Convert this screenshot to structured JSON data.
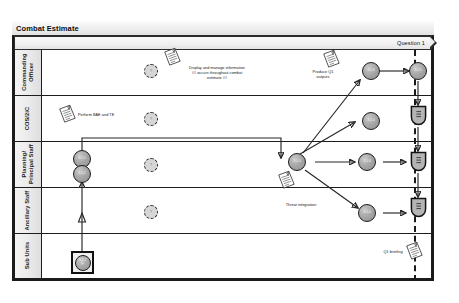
{
  "title": "Combat Estimate",
  "phase": {
    "label": "Question 1"
  },
  "lanes": [
    {
      "id": "commanding-officer",
      "label": "Commanding\nOfficer"
    },
    {
      "id": "cos-2ic",
      "label": "COS/2iC"
    },
    {
      "id": "planning-staff",
      "label": "Planning/\nPrincipal Staff"
    },
    {
      "id": "ancillary-staff",
      "label": "Ancillary Staff"
    },
    {
      "id": "sub-units",
      "label": "Sub Units"
    }
  ],
  "nodes": [
    {
      "id": "n-co-1",
      "label": "3.1.6",
      "lane": "commanding-officer"
    },
    {
      "id": "n-co-2",
      "label": "3.1.5",
      "lane": "commanding-officer"
    },
    {
      "id": "n-cos-1",
      "label": "3.1.4",
      "lane": "cos-2ic"
    },
    {
      "id": "n-ps-1",
      "label": "3.1.1",
      "lane": "planning-staff"
    },
    {
      "id": "n-ps-2",
      "label": "3.1.2",
      "lane": "planning-staff"
    },
    {
      "id": "n-ps-3",
      "label": "3.1.3",
      "lane": "planning-staff"
    },
    {
      "id": "n-ps-4",
      "label": "3.1.4",
      "lane": "planning-staff"
    },
    {
      "id": "n-anc-1",
      "label": "3.1.4",
      "lane": "ancillary-staff"
    },
    {
      "id": "n-sub-1",
      "label": "3.1.2\nF",
      "lane": "sub-units"
    }
  ],
  "ghost_nodes": [
    {
      "id": "g-co",
      "label": "?",
      "lane": "commanding-officer"
    },
    {
      "id": "g-cos",
      "label": "?",
      "lane": "cos-2ic"
    },
    {
      "id": "g-ps",
      "label": "?",
      "lane": "planning-staff"
    },
    {
      "id": "g-anc",
      "label": "?",
      "lane": "ancillary-staff"
    }
  ],
  "artifacts": [
    {
      "id": "a-cos",
      "label": "Q1\nop",
      "lane": "cos-2ic"
    },
    {
      "id": "a-ps",
      "label": "Q1\nop",
      "lane": "planning-staff"
    },
    {
      "id": "a-anc",
      "label": "Q1\nop",
      "lane": "ancillary-staff"
    }
  ],
  "annotations": [
    {
      "id": "note-display-manage",
      "text": "Display and manage information\n## occurs throughout combat\nestimate ##"
    },
    {
      "id": "note-perform-bae",
      "text": "Perform BAE and TE"
    },
    {
      "id": "note-produce-q1",
      "text": "Produce Q1\noutputs"
    },
    {
      "id": "note-threat",
      "text": "Threat integration"
    },
    {
      "id": "note-q1-briefing",
      "text": "Q1 briefing"
    }
  ],
  "colors": {
    "stroke": "#1d1d1d",
    "node_fill": "#a8a8a8",
    "lane_header": "#e8e8e8",
    "band": "#ededed",
    "canvas": "#ffffff"
  }
}
